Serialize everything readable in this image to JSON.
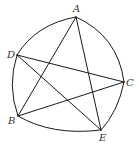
{
  "diagram": {
    "type": "curved-pentagon-with-pentagram",
    "stroke_color": "#1a1a1a",
    "label_color": "#333333",
    "vertices": [
      {
        "id": "A",
        "label": "A",
        "x": 76,
        "y": 17,
        "label_x": 73,
        "label_y": 12
      },
      {
        "id": "C",
        "label": "C",
        "x": 124,
        "y": 82,
        "label_x": 126,
        "label_y": 86
      },
      {
        "id": "E",
        "label": "E",
        "x": 101,
        "y": 130,
        "label_x": 99,
        "label_y": 141
      },
      {
        "id": "B",
        "label": "B",
        "x": 18,
        "y": 116,
        "label_x": 8,
        "label_y": 124
      },
      {
        "id": "D",
        "label": "D",
        "x": 17,
        "y": 55,
        "label_x": 7,
        "label_y": 58
      }
    ],
    "outer_arcs": [
      {
        "from": "A",
        "to": "C"
      },
      {
        "from": "C",
        "to": "E"
      },
      {
        "from": "E",
        "to": "B"
      },
      {
        "from": "B",
        "to": "D"
      },
      {
        "from": "D",
        "to": "A"
      }
    ],
    "chords": [
      {
        "from": "A",
        "to": "B"
      },
      {
        "from": "A",
        "to": "E"
      },
      {
        "from": "D",
        "to": "C"
      },
      {
        "from": "D",
        "to": "E"
      },
      {
        "from": "B",
        "to": "C"
      }
    ]
  }
}
